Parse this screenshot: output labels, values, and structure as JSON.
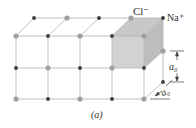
{
  "figure": {
    "caption": "(a)",
    "labels": {
      "cl": "Cl⁻",
      "na": "Na⁺",
      "a0_vertical": "a₀",
      "a0_depth": "a₀"
    },
    "colors": {
      "line": "#b8b8b8",
      "cl_node": "#a0a0a0",
      "na_node": "#3a3a3a",
      "cube_front": "#d2d2d2",
      "cube_top": "#c8c8c8",
      "cube_side": "#bdbdbd",
      "dim_line": "#444444"
    }
  }
}
